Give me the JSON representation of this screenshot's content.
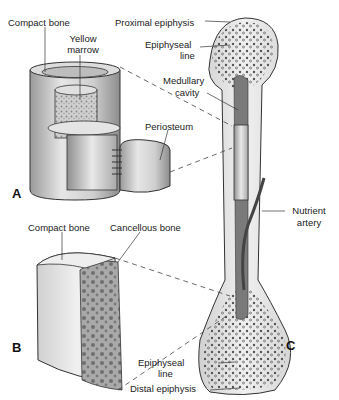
{
  "figure": {
    "panels": [
      {
        "id": "A",
        "label": "A"
      },
      {
        "id": "B",
        "label": "B"
      },
      {
        "id": "C",
        "label": "C"
      }
    ],
    "labels": {
      "compact_bone_a": "Compact bone",
      "yellow_marrow_1": "Yellow",
      "yellow_marrow_2": "marrow",
      "periosteum": "Periosteum",
      "compact_bone_b": "Compact bone",
      "cancellous_bone": "Cancellous bone",
      "proximal_epiphysis": "Proximal epiphysis",
      "epiphyseal_line_top_1": "Epiphyseal",
      "epiphyseal_line_top_2": "line",
      "medullary_cavity_1": "Medullary",
      "medullary_cavity_2": "cavity",
      "nutrient_artery_1": "Nutrient",
      "nutrient_artery_2": "artery",
      "epiphyseal_line_bottom_1": "Epiphyseal",
      "epiphyseal_line_bottom_2": "line",
      "distal_epiphysis": "Distal epiphysis"
    },
    "colors": {
      "bone_light": "#e8e8e8",
      "bone_mid": "#c8c8c8",
      "bone_dark": "#8a8a8a",
      "marrow": "#6e6e6e",
      "line": "#333333"
    }
  }
}
